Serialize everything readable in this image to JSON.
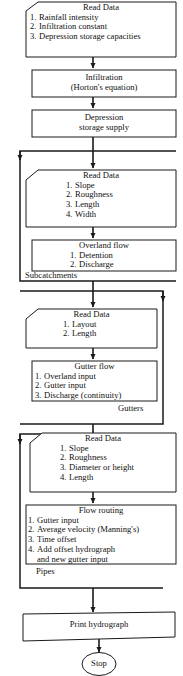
{
  "diagram": {
    "background_color": "#ffffff",
    "line_color": "#1a1a1a",
    "text_color": "#111111"
  },
  "nodes": {
    "read_data_1": {
      "shape": "cut-corner-box",
      "title": "Read Data",
      "items": [
        {
          "num": "1.",
          "text": "Rainfall intensity"
        },
        {
          "num": "2.",
          "text": "Infiltration constant"
        },
        {
          "num": "3.",
          "text": "Depression storage capacities"
        }
      ]
    },
    "infiltration": {
      "shape": "box",
      "line1": "Infiltration",
      "line2": "(Horton's equation)"
    },
    "depression_storage": {
      "shape": "box",
      "line1": "Depression",
      "line2": "storage supply"
    },
    "read_data_2": {
      "shape": "cut-corner-box",
      "title": "Read Data",
      "items": [
        {
          "num": "1.",
          "text": "Slope"
        },
        {
          "num": "2.",
          "text": "Roughness"
        },
        {
          "num": "3.",
          "text": "Length"
        },
        {
          "num": "4.",
          "text": "Width"
        }
      ]
    },
    "overland_flow": {
      "shape": "box",
      "title": "Overland flow",
      "items": [
        {
          "num": "1.",
          "text": "Detention"
        },
        {
          "num": "2.",
          "text": "Discharge"
        }
      ]
    },
    "read_data_3": {
      "shape": "cut-corner-box",
      "title": "Read Data",
      "items": [
        {
          "num": "1.",
          "text": "Layout"
        },
        {
          "num": "2.",
          "text": "Length"
        }
      ]
    },
    "gutter_flow": {
      "shape": "box",
      "title": "Gutter flow",
      "items": [
        {
          "num": "1.",
          "text": "Overland input"
        },
        {
          "num": "2.",
          "text": "Gutter input"
        },
        {
          "num": "3.",
          "text": "Discharge (continuity)"
        }
      ]
    },
    "read_data_4": {
      "shape": "cut-corner-box",
      "title": "Read Data",
      "items": [
        {
          "num": "1.",
          "text": "Slope"
        },
        {
          "num": "2.",
          "text": "Roughness"
        },
        {
          "num": "3.",
          "text": "Diameter or height"
        },
        {
          "num": "4.",
          "text": "Length"
        }
      ]
    },
    "flow_routing": {
      "shape": "box",
      "title": "Flow routing",
      "items": [
        {
          "num": "1.",
          "text": "Gutter input"
        },
        {
          "num": "2.",
          "text": "Average velocity (Manning's)"
        },
        {
          "num": "3.",
          "text": "Time offset"
        },
        {
          "num": "4.",
          "text": "Add offset hydrograph"
        }
      ],
      "continuation": "and new gutter input"
    },
    "print_hydrograph": {
      "shape": "box",
      "label": "Print hydrograph"
    },
    "stop": {
      "shape": "ellipse",
      "label": "Stop"
    }
  },
  "loop_labels": {
    "subcatchments": "Subcatchments",
    "gutters": "Gutters",
    "pipes": "Pipes"
  }
}
